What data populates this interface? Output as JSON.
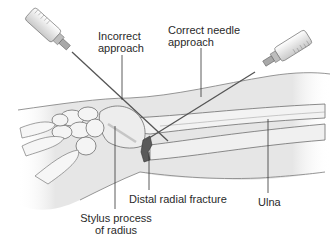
{
  "figure": {
    "colors": {
      "background": "#ffffff",
      "skin_fill": "#e9e9e9",
      "skin_outline": "#8a8a8a",
      "bone_fill": "#f2f2f2",
      "bone_outline": "#6e6e6e",
      "needle": "#555555",
      "syringe_body": "#eeeeee",
      "fracture": "#555555",
      "leader_line": "#333333",
      "label_text": "#2a2a2a"
    }
  },
  "labels": {
    "incorrect": {
      "line1": "Incorrect",
      "line2": "approach"
    },
    "correct": {
      "line1": "Correct needle",
      "line2": "approach"
    },
    "fracture": {
      "text": "Distal radial fracture"
    },
    "stylus": {
      "line1": "Stylus process",
      "line2": "of radius"
    },
    "ulna": {
      "text": "Ulna"
    }
  }
}
